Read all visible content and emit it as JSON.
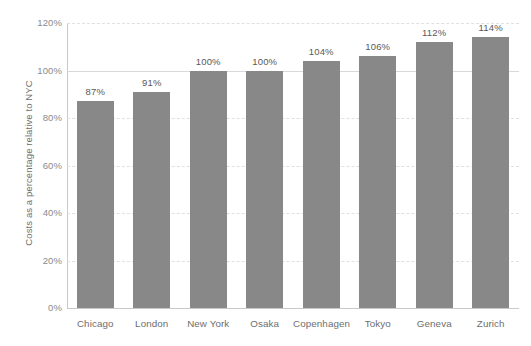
{
  "chart_data": {
    "type": "bar",
    "title": "",
    "subtitle": "",
    "xlabel": "",
    "ylabel": "Costs as a percentage relative to NYC",
    "categories": [
      "Chicago",
      "London",
      "New York",
      "Osaka",
      "Copenhagen",
      "Tokyo",
      "Geneva",
      "Zurich"
    ],
    "values": [
      87,
      91,
      100,
      100,
      104,
      106,
      112,
      114
    ],
    "data_labels": [
      "87%",
      "91%",
      "100%",
      "100%",
      "104%",
      "106%",
      "112%",
      "114%"
    ],
    "ylim": [
      0,
      120
    ],
    "ytick_values": [
      0,
      20,
      40,
      60,
      80,
      100,
      120
    ],
    "ytick_labels": [
      "0%",
      "20%",
      "40%",
      "60%",
      "80%",
      "100%",
      "120%"
    ],
    "grid": {
      "horizontal": true,
      "vertical": false,
      "style": "dashed",
      "emphasized_value": 100,
      "emphasized_style": "solid"
    },
    "legend": {
      "visible": false,
      "position": "none",
      "entries": []
    },
    "series": [
      {
        "name": "Costs relative to NYC",
        "color": "#888888",
        "values": [
          87,
          91,
          100,
          100,
          104,
          106,
          112,
          114
        ]
      }
    ],
    "annotations": []
  },
  "style": {
    "background": "#ffffff",
    "bar_color": "#888888",
    "axis_line_color": "#c9c9c9",
    "gridline_color": "#e3e0dc",
    "gridline_solid_color": "#d8d8d8",
    "tick_label_color": "#8a8a8a",
    "category_label_color": "#6e6e6e",
    "data_label_color": "#595959",
    "axis_title_color": "#6e6e6e"
  }
}
